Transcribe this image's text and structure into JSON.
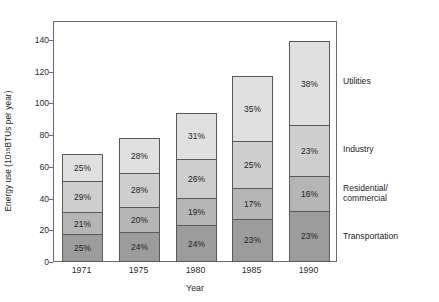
{
  "chart_data": {
    "type": "bar",
    "subtype": "stacked-bar-percentage-labels",
    "title": "",
    "xlabel": "Year",
    "ylabel": "Energy use (10^15 BTUs per year)",
    "ylabel_prefix": "Energy use (10",
    "ylabel_exponent": "15",
    "ylabel_suffix": " BTUs per year)",
    "categories": [
      "1971",
      "1975",
      "1980",
      "1985",
      "1990"
    ],
    "totals": [
      70,
      80,
      96,
      119,
      141
    ],
    "ylim": [
      0,
      152
    ],
    "yticks": [
      0,
      20,
      40,
      60,
      80,
      100,
      120,
      140
    ],
    "grid": false,
    "legend_position": "right",
    "stack_order_bottom_to_top": [
      "Transportation",
      "Residential/commercial",
      "Industry",
      "Utilities"
    ],
    "series": [
      {
        "name": "Transportation",
        "color": "#9c9c9c",
        "legend_label_line1": "Transportation",
        "legend_label_line2": "",
        "percent_labels": [
          "25%",
          "24%",
          "24%",
          "23%",
          "23%"
        ],
        "values": [
          25,
          24,
          24,
          23,
          23
        ]
      },
      {
        "name": "Residential/commercial",
        "color": "#b5b5b5",
        "legend_label_line1": "Residential/",
        "legend_label_line2": "commercial",
        "percent_labels": [
          "21%",
          "20%",
          "19%",
          "17%",
          "16%"
        ],
        "values": [
          21,
          20,
          19,
          17,
          16
        ]
      },
      {
        "name": "Industry",
        "color": "#cecece",
        "legend_label_line1": "Industry",
        "legend_label_line2": "",
        "percent_labels": [
          "29%",
          "28%",
          "26%",
          "25%",
          "23%"
        ],
        "values": [
          29,
          28,
          26,
          25,
          23
        ]
      },
      {
        "name": "Utilities",
        "color": "#e0e0e0",
        "legend_label_line1": "Utilities",
        "legend_label_line2": "",
        "percent_labels": [
          "25%",
          "28%",
          "31%",
          "35%",
          "38%"
        ],
        "values": [
          25,
          28,
          31,
          35,
          38
        ]
      }
    ]
  },
  "axis": {
    "y_tick_labels": [
      "140",
      "120",
      "100",
      "80",
      "60",
      "40",
      "20",
      "0"
    ],
    "x_tick_labels": [
      "1971",
      "1975",
      "1980",
      "1985",
      "1990"
    ],
    "x_title": "Year"
  },
  "legend": {
    "items": [
      {
        "label": "Utilities",
        "label2": ""
      },
      {
        "label": "Industry",
        "label2": ""
      },
      {
        "label": "Residential/",
        "label2": "commercial"
      },
      {
        "label": "Transportation",
        "label2": ""
      }
    ]
  },
  "colors": {
    "utilities": "#e0e0e0",
    "industry": "#cecece",
    "residential_commercial": "#b5b5b5",
    "transportation": "#9c9c9c",
    "frame": "#6b6b6b",
    "segment_border": "#595959",
    "text": "#1c1c1c",
    "background": "#ffffff"
  }
}
